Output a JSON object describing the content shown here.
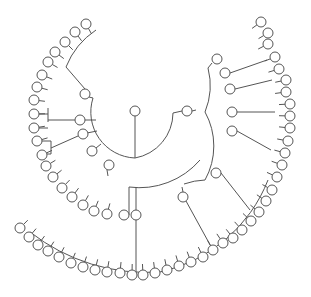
{
  "diagram": {
    "type": "radial-tree",
    "node_radius": 5,
    "stroke_color": "#555555",
    "fill_color": "#ffffff",
    "root": [
      135,
      111
    ],
    "nodes": [
      [
        135,
        111
      ],
      [
        187,
        111
      ],
      [
        85,
        94
      ],
      [
        80,
        120
      ],
      [
        83,
        134
      ],
      [
        92,
        151
      ],
      [
        109,
        165
      ],
      [
        124,
        215
      ],
      [
        136,
        215
      ],
      [
        217,
        59
      ],
      [
        225,
        73
      ],
      [
        230,
        89
      ],
      [
        232,
        112
      ],
      [
        232,
        131
      ],
      [
        216,
        173
      ],
      [
        183,
        197
      ],
      [
        86,
        24
      ],
      [
        75,
        32
      ],
      [
        65,
        42
      ],
      [
        55,
        52
      ],
      [
        48,
        62
      ],
      [
        42,
        75
      ],
      [
        37,
        87
      ],
      [
        34,
        100
      ],
      [
        34,
        114
      ],
      [
        34,
        128
      ],
      [
        37,
        141
      ],
      [
        42,
        155
      ],
      [
        46,
        166
      ],
      [
        53,
        177
      ],
      [
        62,
        188
      ],
      [
        72,
        197
      ],
      [
        83,
        205
      ],
      [
        94,
        211
      ],
      [
        107,
        214
      ],
      [
        20,
        228
      ],
      [
        29,
        237
      ],
      [
        38,
        245
      ],
      [
        48,
        251
      ],
      [
        59,
        257
      ],
      [
        71,
        263
      ],
      [
        83,
        267
      ],
      [
        95,
        270
      ],
      [
        107,
        272
      ],
      [
        120,
        273
      ],
      [
        132,
        275
      ],
      [
        143,
        275
      ],
      [
        155,
        273
      ],
      [
        167,
        270
      ],
      [
        179,
        266
      ],
      [
        191,
        262
      ],
      [
        203,
        257
      ],
      [
        213,
        250
      ],
      [
        223,
        243
      ],
      [
        233,
        238
      ],
      [
        242,
        230
      ],
      [
        251,
        221
      ],
      [
        259,
        212
      ],
      [
        266,
        201
      ],
      [
        272,
        190
      ],
      [
        277,
        177
      ],
      [
        282,
        165
      ],
      [
        285,
        153
      ],
      [
        288,
        141
      ],
      [
        290,
        128
      ],
      [
        290,
        116
      ],
      [
        290,
        104
      ],
      [
        286,
        92
      ],
      [
        286,
        80
      ],
      [
        279,
        69
      ],
      [
        275,
        57
      ],
      [
        268,
        44
      ],
      [
        268,
        33
      ],
      [
        261,
        22
      ]
    ],
    "links": [
      "M135,116 L135,158",
      "M93,98 A46,46 0 0 0 135,158 A46,46 0 0 0 173,113 L182,111",
      "M89,97 L93,98",
      "M85,89 L66,67 A80,80 0 0 1 96,30",
      "M85,120 L96,120",
      "M87,133 L97,131",
      "M96,148 L101,144",
      "M107,170 L108,176",
      "M192,111 L196,110",
      "M184,184 A70,70 0 0 1 205,180 A70,70 0 0 0 205,112 A70,70 0 0 0 208,68",
      "M129,215 L129,187 A80,80 0 0 0 200,160",
      "M136,210 L136,187",
      "M183,192 L182,187",
      "M186,201 L214,252",
      "M212,63 L208,68",
      "M230,73 L267,60",
      "M235,89 L272,80",
      "M237,112 L275,112",
      "M237,131 L271,150",
      "M221,173 L250,210",
      "M30,232 A190,190 0 0 0 160,272 A150,150 0 0 0 268,180",
      "M48,108 L48,122 M39,114 L48,114 M39,128 L48,128 M48,120 L75,120",
      "M41,141 L51,141 M51,141 L51,154 M46,154 L51,154 M51,148 L78,136",
      "M136,220 L136,275"
    ]
  }
}
